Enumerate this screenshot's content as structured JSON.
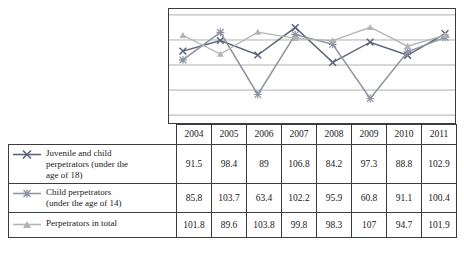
{
  "chart_data": {
    "type": "line",
    "title": "",
    "xlabel": "",
    "ylabel": "",
    "grid": true,
    "legend_position": "table-left",
    "categories": [
      "2004",
      "2005",
      "2006",
      "2007",
      "2008",
      "2009",
      "2010",
      "2011"
    ],
    "ylim": [
      50,
      115
    ],
    "series": [
      {
        "name": "Juvenile and child perpetrators (under the age of 18)",
        "marker": "cross",
        "color": "#5b6478",
        "values": [
          91.5,
          98.4,
          89,
          106.8,
          84.2,
          97.3,
          88.8,
          102.9
        ]
      },
      {
        "name": "Child perpetrators (under the age of 14)",
        "marker": "asterisk",
        "color": "#8d93a3",
        "values": [
          85.8,
          103.7,
          63.4,
          102.2,
          95.9,
          60.8,
          91.1,
          100.4
        ]
      },
      {
        "name": "Perpetrators in total",
        "marker": "triangle",
        "color": "#b3b3b3",
        "values": [
          101.8,
          89.6,
          103.8,
          99.8,
          98.3,
          107,
          94.7,
          101.9
        ]
      }
    ]
  },
  "table": {
    "corner": "",
    "columns": [
      "2004",
      "2005",
      "2006",
      "2007",
      "2008",
      "2009",
      "2010",
      "2011"
    ],
    "rows": [
      {
        "label_line1": "Juvenile and child",
        "label_line2": "perpetrators (under the",
        "label_line3": "age of 18)",
        "marker": "cross",
        "values": [
          "91.5",
          "98.4",
          "89",
          "106.8",
          "84.2",
          "97.3",
          "88.8",
          "102.9"
        ]
      },
      {
        "label_line1": "Child perpetrators",
        "label_line2": "(under the age of 14)",
        "label_line3": "",
        "marker": "asterisk",
        "values": [
          "85.8",
          "103.7",
          "63.4",
          "102.2",
          "95.9",
          "60.8",
          "91.1",
          "100.4"
        ]
      },
      {
        "label_line1": "Perpetrators in total",
        "label_line2": "",
        "label_line3": "",
        "marker": "triangle",
        "values": [
          "101.8",
          "89.6",
          "103.8",
          "99.8",
          "98.3",
          "107",
          "94.7",
          "101.9"
        ]
      }
    ]
  },
  "colors": {
    "series1": "#5b6478",
    "series2": "#8d93a3",
    "series3": "#b3b3b3",
    "grid": "#9a9a9a",
    "border": "#3c3c3c"
  }
}
